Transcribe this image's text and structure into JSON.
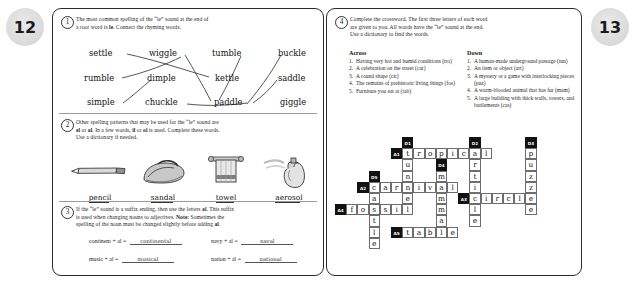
{
  "pages": {
    "left_number": "12",
    "right_number": "13"
  },
  "exercise1": {
    "number": "1",
    "instruction_line1": "The most common spelling of the “le” sound at the end of",
    "instruction_line2_pre": "a root word is ",
    "instruction_bold": "le",
    "instruction_line2_post": ". Connect the rhyming words.",
    "words": [
      {
        "text": "settle",
        "x": 14,
        "y": 2
      },
      {
        "text": "wiggle",
        "x": 74,
        "y": 2
      },
      {
        "text": "tumble",
        "x": 137,
        "y": 2
      },
      {
        "text": "buckle",
        "x": 203,
        "y": 2
      },
      {
        "text": "rumble",
        "x": 9,
        "y": 27
      },
      {
        "text": "dimple",
        "x": 72,
        "y": 27
      },
      {
        "text": "kettle",
        "x": 140,
        "y": 27
      },
      {
        "text": "saddle",
        "x": 203,
        "y": 27
      },
      {
        "text": "simple",
        "x": 12,
        "y": 51
      },
      {
        "text": "chuckle",
        "x": 70,
        "y": 51
      },
      {
        "text": "paddle",
        "x": 139,
        "y": 51
      },
      {
        "text": "giggle",
        "x": 205,
        "y": 51
      }
    ],
    "connections": [
      "M52,8 C80,14 110,24 134,31",
      "M110,9 C118,22 128,40 136,55",
      "M106,11 C92,18 72,26 47,32",
      "M166,10 C160,24 152,40 144,54",
      "M48,57 C60,48 66,42 76,34",
      "M112,58 C130,60 150,60 172,57",
      "M172,58 C182,46 196,28 206,9",
      "M202,34 C196,42 188,50 178,57"
    ]
  },
  "exercise2": {
    "number": "2",
    "instruction_line1": "Other spelling patterns that may be used for the “le” sound are",
    "instruction_line2_a": "el",
    "instruction_line2_b": " or ",
    "instruction_line2_c": "al",
    "instruction_line2_d": ". In a few words, ",
    "instruction_line2_e": "il",
    "instruction_line2_f": " or ",
    "instruction_line2_g": "ol",
    "instruction_line2_h": " is used. Complete these words.",
    "instruction_line3": "Use a dictionary if needed.",
    "pictures": [
      {
        "name": "pencil",
        "label_stem": "penci",
        "label_end": "l"
      },
      {
        "name": "sandal",
        "label_stem": "sanda",
        "label_end": "l"
      },
      {
        "name": "towel",
        "label_stem": "towe",
        "label_end": "l"
      },
      {
        "name": "aerosol",
        "label_stem": "aeroso",
        "label_end": "l"
      }
    ]
  },
  "exercise3": {
    "number": "3",
    "instruction_line1_pre": "If the “le” sound is a suffix ending, then use the letters ",
    "instruction_line1_bold": "al",
    "instruction_line1_post": ". This suffix",
    "instruction_line2_pre": "is used when changing nouns to adjectives. ",
    "instruction_line2_bold": "Note",
    "instruction_line2_post": ": Sometimes the",
    "instruction_line3_pre": "spelling of the noun must be changed slightly before adding ",
    "instruction_line3_bold": "al",
    "instruction_line3_post": ".",
    "equations": [
      {
        "prompt": "continent + al =",
        "answer": "continental"
      },
      {
        "prompt": "navy + al =",
        "answer": "naval"
      },
      {
        "prompt": "music + al =",
        "answer": "musical"
      },
      {
        "prompt": "nation + al =",
        "answer": "national"
      }
    ]
  },
  "exercise4": {
    "number": "4",
    "instruction_line1": "Complete the crossword. The first three letters of each word",
    "instruction_line2": "are given to you. All words have the “le” sound at the end.",
    "instruction_line3": "Use a dictionary to find the words.",
    "across_heading": "Across",
    "down_heading": "Down",
    "across": [
      {
        "num": "1.",
        "text": "Having very hot and humid conditions (tro)"
      },
      {
        "num": "2.",
        "text": "A celebration on the street (car)"
      },
      {
        "num": "3.",
        "text": "A round shape (cir)"
      },
      {
        "num": "4.",
        "text": "The remains of prehistoric living things (fos)"
      },
      {
        "num": "5.",
        "text": "Furniture you eat at (tab)"
      }
    ],
    "down": [
      {
        "num": "1.",
        "text": "A human-made underground passage (tun)"
      },
      {
        "num": "2.",
        "text": "An item or object (art)"
      },
      {
        "num": "3.",
        "text": "A mystery or a game with interlocking pieces (puz)"
      },
      {
        "num": "4.",
        "text": "A warm-blooded animal that has fur (mam)"
      },
      {
        "num": "5.",
        "text": "A large building with thick walls, towers, and battlements (cas)"
      }
    ]
  },
  "crossword": {
    "cell_size": 11.2,
    "numbered": [
      {
        "label": "D1",
        "col": 6,
        "row": 0
      },
      {
        "label": "D2",
        "col": 12,
        "row": 0
      },
      {
        "label": "D3",
        "col": 17,
        "row": 0
      },
      {
        "label": "A1",
        "col": 5,
        "row": 1
      },
      {
        "label": "D4",
        "col": 9,
        "row": 2
      },
      {
        "label": "D5",
        "col": 3,
        "row": 3
      },
      {
        "label": "A2",
        "col": 2,
        "row": 4
      },
      {
        "label": "A3",
        "col": 11,
        "row": 5
      },
      {
        "label": "A4",
        "col": 0,
        "row": 6
      },
      {
        "label": "A5",
        "col": 5,
        "row": 8
      }
    ],
    "letters": [
      {
        "ch": "t",
        "col": 6,
        "row": 1
      },
      {
        "ch": "r",
        "col": 7,
        "row": 1
      },
      {
        "ch": "o",
        "col": 8,
        "row": 1
      },
      {
        "ch": "p",
        "col": 9,
        "row": 1
      },
      {
        "ch": "i",
        "col": 10,
        "row": 1
      },
      {
        "ch": "c",
        "col": 11,
        "row": 1
      },
      {
        "ch": "a",
        "col": 12,
        "row": 1
      },
      {
        "ch": "l",
        "col": 13,
        "row": 1
      },
      {
        "ch": "p",
        "col": 17,
        "row": 1
      },
      {
        "ch": "u",
        "col": 6,
        "row": 2
      },
      {
        "ch": "r",
        "col": 12,
        "row": 2
      },
      {
        "ch": "u",
        "col": 17,
        "row": 2
      },
      {
        "ch": "n",
        "col": 6,
        "row": 3
      },
      {
        "ch": "m",
        "col": 9,
        "row": 3
      },
      {
        "ch": "t",
        "col": 12,
        "row": 3
      },
      {
        "ch": "z",
        "col": 17,
        "row": 3
      },
      {
        "ch": "c",
        "col": 3,
        "row": 4
      },
      {
        "ch": "a",
        "col": 4,
        "row": 4
      },
      {
        "ch": "r",
        "col": 5,
        "row": 4
      },
      {
        "ch": "n",
        "col": 6,
        "row": 4
      },
      {
        "ch": "i",
        "col": 7,
        "row": 4
      },
      {
        "ch": "v",
        "col": 8,
        "row": 4
      },
      {
        "ch": "a",
        "col": 9,
        "row": 4
      },
      {
        "ch": "l",
        "col": 10,
        "row": 4
      },
      {
        "ch": "i",
        "col": 12,
        "row": 4
      },
      {
        "ch": "z",
        "col": 17,
        "row": 4
      },
      {
        "ch": "a",
        "col": 3,
        "row": 5
      },
      {
        "ch": "e",
        "col": 6,
        "row": 5
      },
      {
        "ch": "m",
        "col": 9,
        "row": 5
      },
      {
        "ch": "c",
        "col": 12,
        "row": 5
      },
      {
        "ch": "i",
        "col": 13,
        "row": 5
      },
      {
        "ch": "r",
        "col": 14,
        "row": 5
      },
      {
        "ch": "c",
        "col": 15,
        "row": 5
      },
      {
        "ch": "l",
        "col": 16,
        "row": 5
      },
      {
        "ch": "e",
        "col": 17,
        "row": 5
      },
      {
        "ch": "f",
        "col": 1,
        "row": 6
      },
      {
        "ch": "o",
        "col": 2,
        "row": 6
      },
      {
        "ch": "s",
        "col": 3,
        "row": 6
      },
      {
        "ch": "s",
        "col": 4,
        "row": 6
      },
      {
        "ch": "i",
        "col": 5,
        "row": 6
      },
      {
        "ch": "l",
        "col": 6,
        "row": 6
      },
      {
        "ch": "m",
        "col": 9,
        "row": 6
      },
      {
        "ch": "l",
        "col": 12,
        "row": 6
      },
      {
        "ch": "e",
        "col": 17,
        "row": 6
      },
      {
        "ch": "t",
        "col": 3,
        "row": 7
      },
      {
        "ch": "a",
        "col": 9,
        "row": 7
      },
      {
        "ch": "e",
        "col": 12,
        "row": 7
      },
      {
        "ch": "l",
        "col": 3,
        "row": 8
      },
      {
        "ch": "t",
        "col": 6,
        "row": 8
      },
      {
        "ch": "a",
        "col": 7,
        "row": 8
      },
      {
        "ch": "b",
        "col": 8,
        "row": 8
      },
      {
        "ch": "l",
        "col": 9,
        "row": 8
      },
      {
        "ch": "e",
        "col": 10,
        "row": 8
      },
      {
        "ch": "e",
        "col": 3,
        "row": 9
      }
    ]
  }
}
